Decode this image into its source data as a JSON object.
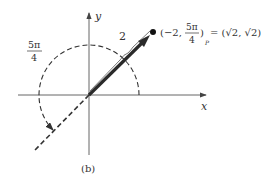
{
  "figure": {
    "caption": "(b)",
    "axes": {
      "x_label": "x",
      "y_label": "y"
    },
    "angle_label": {
      "numerator": "5π",
      "denominator": "4"
    },
    "radius_label": "2",
    "point_label": {
      "open": "(−2, ",
      "frac_num": "5π",
      "frac_den": "4",
      "close": ")",
      "subscript": "P",
      "equals": "= (√2, √2)"
    },
    "colors": {
      "ink": "#333333",
      "arrow": "#2a2a2a"
    }
  }
}
